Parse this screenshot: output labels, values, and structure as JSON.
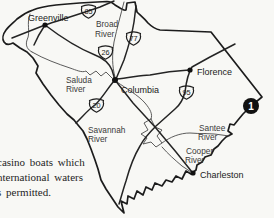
{
  "map": {
    "title": "south-carolina-highway-map",
    "cities": [
      {
        "name": "Greenville"
      },
      {
        "name": "Columbia"
      },
      {
        "name": "Florence"
      },
      {
        "name": "Charleston"
      }
    ],
    "rivers": [
      {
        "line1": "Broad",
        "line2": "River"
      },
      {
        "line1": "Saluda",
        "line2": "River"
      },
      {
        "line1": "Savannah",
        "line2": "River"
      },
      {
        "line1": "Santee",
        "line2": "River"
      },
      {
        "line1": "Cooper",
        "line2": "River"
      }
    ],
    "routes": [
      {
        "number": "85"
      },
      {
        "number": "77"
      },
      {
        "number": "26"
      },
      {
        "number": "95"
      },
      {
        "number": "20"
      }
    ],
    "marker": {
      "label": "1"
    },
    "colors": {
      "background": "#f8f8f5",
      "border_line": "#1c1c1c",
      "river_line": "#4a4a4a",
      "marker_fill": "#111111"
    }
  },
  "caption": {
    "lines": [
      "casino boats which",
      "nternational waters",
      "s permitted."
    ]
  }
}
